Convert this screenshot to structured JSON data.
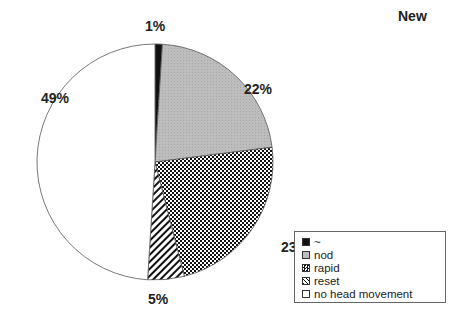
{
  "chart_data": {
    "type": "pie",
    "title": "New",
    "categories": [
      "~",
      "nod",
      "rapid",
      "reset",
      "no head movement"
    ],
    "values": [
      1,
      22,
      23,
      5,
      49
    ],
    "labels": [
      "1%",
      "22%",
      "23%",
      "5%",
      "49%"
    ],
    "fills": [
      "solid-black",
      "light-gray",
      "checkerboard",
      "diagonal-hatch",
      "white"
    ],
    "legend_position": "bottom-right"
  },
  "legend": {
    "items": [
      {
        "label": "~"
      },
      {
        "label": "nod"
      },
      {
        "label": "rapid"
      },
      {
        "label": "reset"
      },
      {
        "label": "no head movement"
      }
    ]
  }
}
